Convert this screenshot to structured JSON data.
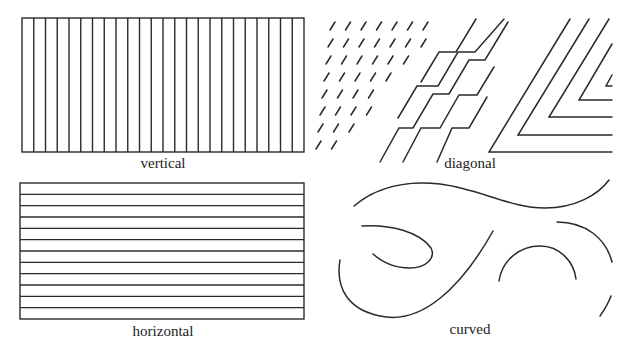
{
  "figure": {
    "panels": [
      {
        "id": "vertical",
        "label": "vertical",
        "line_count": 24,
        "box": {
          "x": 22,
          "y": 18,
          "w": 282,
          "h": 134
        }
      },
      {
        "id": "diagonal",
        "label": "diagonal"
      },
      {
        "id": "horizontal",
        "label": "horizontal",
        "line_count": 12,
        "box": {
          "x": 20,
          "y": 183,
          "w": 284,
          "h": 136
        }
      },
      {
        "id": "curved",
        "label": "curved"
      }
    ],
    "stroke_color": "#2a2a2a"
  }
}
